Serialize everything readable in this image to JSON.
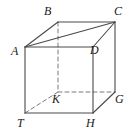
{
  "figure": {
    "kind": "geometry-diagram",
    "shape_name": "rectangular-prism",
    "projection": "oblique",
    "canvas": {
      "width": 134,
      "height": 137
    },
    "stroke_color": "#4a4a4a",
    "hidden_stroke_color": "#7a7a7a",
    "background_color": "#ffffff",
    "label_color": "#1a1a1a",
    "vertices": [
      {
        "id": "A",
        "label": "A",
        "x": 25,
        "y": 47,
        "label_x": 11,
        "label_y": 45,
        "hidden": false
      },
      {
        "id": "B",
        "label": "B",
        "x": 58,
        "y": 22,
        "label_x": 44,
        "label_y": 5,
        "hidden": false
      },
      {
        "id": "C",
        "label": "C",
        "x": 115,
        "y": 22,
        "label_x": 114,
        "label_y": 5,
        "hidden": false
      },
      {
        "id": "D",
        "label": "D",
        "x": 93,
        "y": 47,
        "label_x": 90,
        "label_y": 44,
        "hidden": false
      },
      {
        "id": "T",
        "label": "T",
        "x": 25,
        "y": 113,
        "label_x": 17,
        "label_y": 117,
        "hidden": false
      },
      {
        "id": "K",
        "label": "K",
        "x": 58,
        "y": 92,
        "label_x": 52,
        "label_y": 93,
        "hidden": true
      },
      {
        "id": "G",
        "label": "G",
        "x": 115,
        "y": 92,
        "label_x": 115,
        "label_y": 93,
        "hidden": false
      },
      {
        "id": "H",
        "label": "H",
        "x": 93,
        "y": 113,
        "label_x": 86,
        "label_y": 117,
        "hidden": false
      }
    ],
    "solid_edges": [
      {
        "from": "A",
        "to": "B"
      },
      {
        "from": "B",
        "to": "C"
      },
      {
        "from": "C",
        "to": "D"
      },
      {
        "from": "D",
        "to": "A"
      },
      {
        "from": "A",
        "to": "C"
      },
      {
        "from": "A",
        "to": "T"
      },
      {
        "from": "D",
        "to": "H"
      },
      {
        "from": "C",
        "to": "G"
      },
      {
        "from": "T",
        "to": "H"
      },
      {
        "from": "H",
        "to": "G"
      }
    ],
    "dashed_edges": [
      {
        "from": "B",
        "to": "K"
      },
      {
        "from": "K",
        "to": "T"
      },
      {
        "from": "K",
        "to": "G"
      }
    ]
  }
}
